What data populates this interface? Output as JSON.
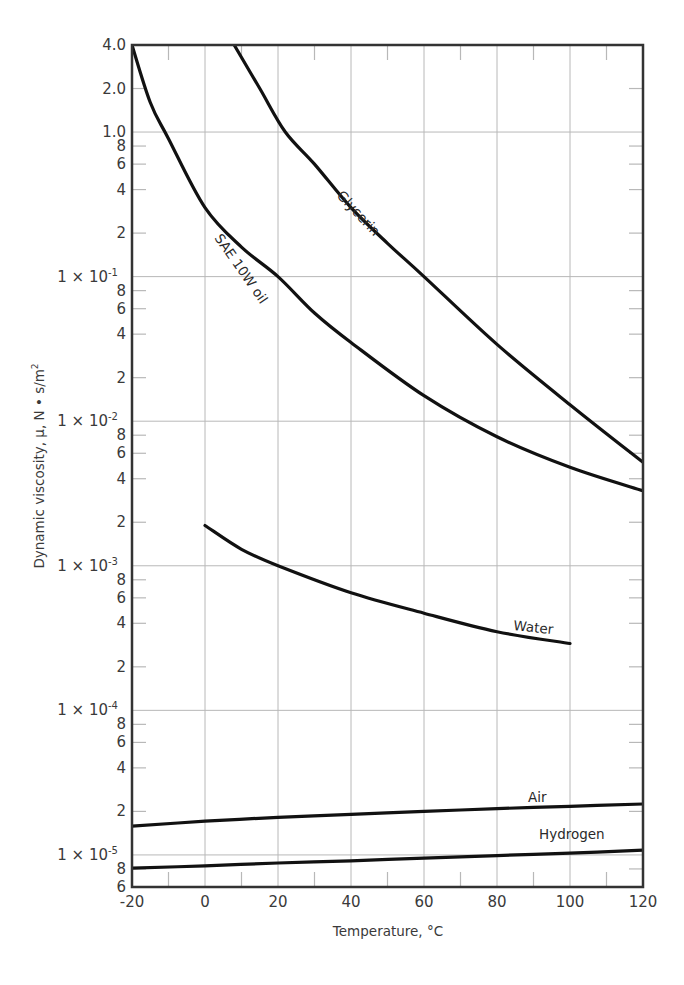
{
  "chart_data": {
    "type": "line",
    "title": "",
    "xlabel": "Temperature, °C",
    "ylabel": "Dynamic viscosity, μ, N • s/m²",
    "yscale": "log",
    "xlim": [
      -20,
      120
    ],
    "ylim": [
      6e-06,
      4.0
    ],
    "grid": true,
    "x_ticks": [
      -20,
      0,
      20,
      40,
      60,
      80,
      100,
      120
    ],
    "x_tick_labels": [
      "-20",
      "0",
      "20",
      "40",
      "60",
      "80",
      "100",
      "120"
    ],
    "y_tick_labels": [
      {
        "value": 4.0,
        "label": "4.0"
      },
      {
        "value": 2.0,
        "label": "2.0"
      },
      {
        "value": 1.0,
        "label": "1.0"
      },
      {
        "value": 0.8,
        "label": "8"
      },
      {
        "value": 0.6,
        "label": "6"
      },
      {
        "value": 0.4,
        "label": "4"
      },
      {
        "value": 0.2,
        "label": "2"
      },
      {
        "value": 0.1,
        "label": "1 × 10",
        "exp": "-1"
      },
      {
        "value": 0.08,
        "label": "8"
      },
      {
        "value": 0.06,
        "label": "6"
      },
      {
        "value": 0.04,
        "label": "4"
      },
      {
        "value": 0.02,
        "label": "2"
      },
      {
        "value": 0.01,
        "label": "1 × 10",
        "exp": "-2"
      },
      {
        "value": 0.008,
        "label": "8"
      },
      {
        "value": 0.006,
        "label": "6"
      },
      {
        "value": 0.004,
        "label": "4"
      },
      {
        "value": 0.002,
        "label": "2"
      },
      {
        "value": 0.001,
        "label": "1 × 10",
        "exp": "-3"
      },
      {
        "value": 0.0008,
        "label": "8"
      },
      {
        "value": 0.0006,
        "label": "6"
      },
      {
        "value": 0.0004,
        "label": "4"
      },
      {
        "value": 0.0002,
        "label": "2"
      },
      {
        "value": 0.0001,
        "label": "1 × 10",
        "exp": "-4"
      },
      {
        "value": 8e-05,
        "label": "8"
      },
      {
        "value": 6e-05,
        "label": "6"
      },
      {
        "value": 4e-05,
        "label": "4"
      },
      {
        "value": 2e-05,
        "label": "2"
      },
      {
        "value": 1e-05,
        "label": "1 × 10",
        "exp": "-5"
      },
      {
        "value": 8e-06,
        "label": "8"
      },
      {
        "value": 6e-06,
        "label": "6"
      }
    ],
    "series": [
      {
        "name": "SAE 10W oil",
        "label_pos": {
          "x": 214,
          "y": 238,
          "angle": 55
        },
        "points": [
          [
            -20,
            4.0
          ],
          [
            -15,
            1.6
          ],
          [
            -10,
            0.9
          ],
          [
            0,
            0.3
          ],
          [
            10,
            0.16
          ],
          [
            20,
            0.1
          ],
          [
            30,
            0.056
          ],
          [
            40,
            0.035
          ],
          [
            60,
            0.015
          ],
          [
            80,
            0.0078
          ],
          [
            100,
            0.0048
          ],
          [
            120,
            0.0033
          ]
        ]
      },
      {
        "name": "Glycerin",
        "label_pos": {
          "x": 336,
          "y": 196,
          "angle": 47
        },
        "points": [
          [
            8,
            4.0
          ],
          [
            15,
            2.0
          ],
          [
            22,
            1.0
          ],
          [
            30,
            0.6
          ],
          [
            40,
            0.3
          ],
          [
            50,
            0.17
          ],
          [
            60,
            0.1
          ],
          [
            80,
            0.034
          ],
          [
            100,
            0.013
          ],
          [
            120,
            0.0052
          ]
        ]
      },
      {
        "name": "Water",
        "label_pos": {
          "x": 513,
          "y": 630,
          "angle": 6
        },
        "points": [
          [
            0,
            0.0019
          ],
          [
            10,
            0.0013
          ],
          [
            20,
            0.001
          ],
          [
            40,
            0.00065
          ],
          [
            60,
            0.00047
          ],
          [
            80,
            0.00035
          ],
          [
            100,
            0.00029
          ]
        ]
      },
      {
        "name": "Air",
        "label_pos": {
          "x": 528,
          "y": 802,
          "angle": 0
        },
        "points": [
          [
            -20,
            1.58e-05
          ],
          [
            0,
            1.71e-05
          ],
          [
            20,
            1.82e-05
          ],
          [
            40,
            1.91e-05
          ],
          [
            60,
            2e-05
          ],
          [
            80,
            2.09e-05
          ],
          [
            100,
            2.17e-05
          ],
          [
            120,
            2.25e-05
          ]
        ]
      },
      {
        "name": "Hydrogen",
        "label_pos": {
          "x": 539,
          "y": 839,
          "angle": 0
        },
        "points": [
          [
            -20,
            8.1e-06
          ],
          [
            0,
            8.4e-06
          ],
          [
            20,
            8.8e-06
          ],
          [
            40,
            9.1e-06
          ],
          [
            60,
            9.5e-06
          ],
          [
            80,
            9.9e-06
          ],
          [
            100,
            1.03e-05
          ],
          [
            120,
            1.08e-05
          ]
        ]
      }
    ]
  },
  "colors": {
    "curve": "#111111",
    "frame": "#333333",
    "grid": "#b8b8b8",
    "text": "#3a3a3a"
  }
}
